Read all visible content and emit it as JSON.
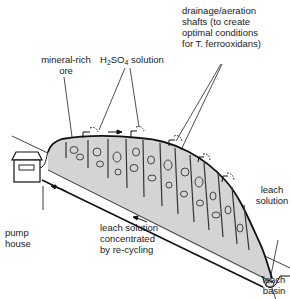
{
  "diagram": {
    "type": "heap-leaching-process",
    "labels": {
      "mineral_ore": {
        "line1": "mineral-rich",
        "line2": "ore"
      },
      "acid_solution": {
        "prefix": "H",
        "sub1": "2",
        "mid": "SO",
        "sub2": "4",
        "suffix": " solution"
      },
      "shafts": {
        "line1": "drainage/aeration",
        "line2": "shafts (to create",
        "line3": "optimal conditions",
        "line4": "for T. ferrooxidans)"
      },
      "leach_solution": {
        "line1": "leach",
        "line2": "solution"
      },
      "pump_house": {
        "line1": "pump",
        "line2": "house"
      },
      "recycle": {
        "line1": "leach solution",
        "line2": "concentrated",
        "line3": "by re-cycling"
      },
      "leach_basin": {
        "line1": "leach",
        "line2": "basin"
      }
    },
    "colors": {
      "ore_fill": "#d4d4d4",
      "line": "#111111",
      "background": "#ffffff"
    }
  }
}
